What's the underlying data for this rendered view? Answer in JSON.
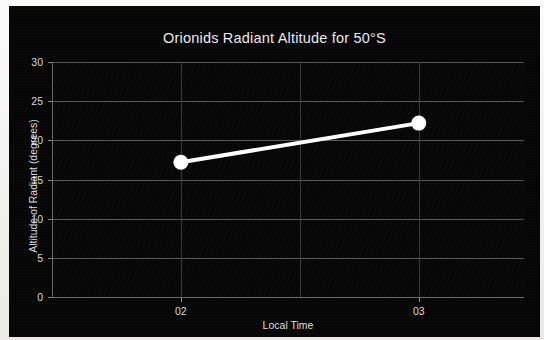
{
  "figure": {
    "background_color": "#050505",
    "frame_color": "#f0eeea",
    "series_color": "#ffffff",
    "grid_color": "#585858",
    "text_color": "#e0e0e0"
  },
  "chart_data": {
    "type": "line",
    "title": "Orionids Radiant Altitude for 50°S",
    "xlabel": "Local Time",
    "ylabel": "Altitude of Radiant (degrees)",
    "x_categories": [
      "02",
      "03"
    ],
    "x_tick_labels": [
      "02",
      "03"
    ],
    "y_tick_labels": [
      "0",
      "5",
      "10",
      "15",
      "20",
      "25",
      "30"
    ],
    "y_ticks": [
      0,
      5,
      10,
      15,
      20,
      25,
      30
    ],
    "ylim": [
      0,
      30
    ],
    "grid": true,
    "legend": null,
    "series": [
      {
        "name": "Radiant altitude",
        "x": [
          "02",
          "03"
        ],
        "values": [
          17.2,
          22.2
        ],
        "marker": "circle",
        "marker_color": "#ffffff",
        "line_color": "#ffffff"
      }
    ],
    "points": [
      {
        "x_label": "02",
        "y": 17.2
      },
      {
        "x_label": "03",
        "y": 22.2
      }
    ]
  }
}
